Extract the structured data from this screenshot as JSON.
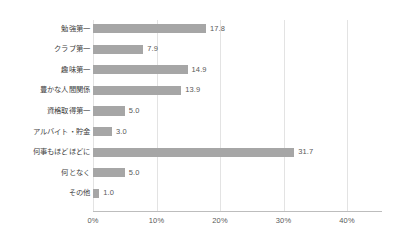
{
  "chart_data": {
    "type": "bar",
    "orientation": "horizontal",
    "title": "",
    "subtitle": "",
    "xlabel": "",
    "ylabel": "",
    "xlim": [
      0,
      40
    ],
    "xticks": [
      0,
      10,
      20,
      30,
      40
    ],
    "xtick_labels": [
      "0%",
      "10%",
      "20%",
      "30%",
      "40%"
    ],
    "grid": true,
    "grid_axis": "x",
    "legend": false,
    "legend_position": "none",
    "bar_color": "#a6a6a6",
    "gridline_color": "#e3e3e3",
    "axis_color": "#bdbdbd",
    "text_color": "#3f3f3f",
    "value_text_color": "#595959",
    "background_color": "#ffffff",
    "value_label_format": "one-decimal",
    "categories": [
      "勉強第一",
      "クラブ第一",
      "趣味第一",
      "豊かな人間関係",
      "資格取得第一",
      "アルバイト・貯金",
      "何事もほどほどに",
      "何となく",
      "その他"
    ],
    "values": [
      17.8,
      7.9,
      14.9,
      13.9,
      5.0,
      3.0,
      31.7,
      5.0,
      1.0
    ],
    "value_labels": [
      "17.8",
      "7.9",
      "14.9",
      "13.9",
      "5.0",
      "3.0",
      "31.7",
      "5.0",
      "1.0"
    ]
  }
}
